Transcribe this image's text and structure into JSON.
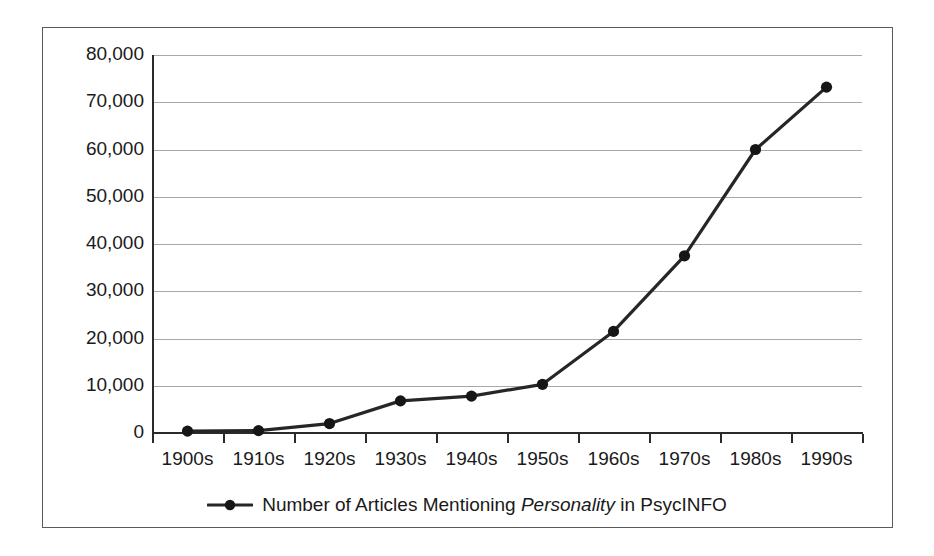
{
  "chart_data": {
    "type": "line",
    "title": "",
    "xlabel": "",
    "ylabel": "",
    "categories": [
      "1900s",
      "1910s",
      "1920s",
      "1930s",
      "1940s",
      "1950s",
      "1960s",
      "1970s",
      "1980s",
      "1990s"
    ],
    "series": [
      {
        "name": "Number of Articles Mentioning Personality in PsycINFO",
        "values": [
          400,
          500,
          2000,
          6800,
          7800,
          10300,
          21500,
          37500,
          60000,
          73200
        ]
      }
    ],
    "ylim": [
      0,
      80000
    ],
    "ytick_labels": [
      "80,000",
      "70,000",
      "60,000",
      "50,000",
      "40,000",
      "30,000",
      "20,000",
      "10,000",
      "0"
    ],
    "ytick_values": [
      80000,
      70000,
      60000,
      50000,
      40000,
      30000,
      20000,
      10000,
      0
    ],
    "grid": true,
    "legend_position": "bottom",
    "marker": "filled-circle",
    "line_color": "#262626",
    "grid_color": "#a9a9a9",
    "axis_color": "#2b2b2b",
    "background_color": "#ffffff"
  },
  "legend": {
    "label_prefix": "Number of Articles Mentioning ",
    "label_emphasis": "Personality",
    "label_suffix": " in PsycINFO"
  }
}
